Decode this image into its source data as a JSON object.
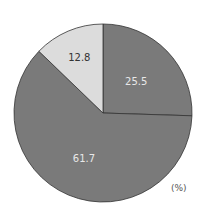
{
  "chart_data": {
    "type": "pie",
    "title": "",
    "unit_label": "(%)",
    "slices": [
      {
        "label": "25.5",
        "value": 25.5,
        "color": "#7a7a7a",
        "text_color": "#e8e8e8"
      },
      {
        "label": "61.7",
        "value": 61.7,
        "color": "#7a7a7a",
        "text_color": "#e8e8e8"
      },
      {
        "label": "12.8",
        "value": 12.8,
        "color": "#dcdcdc",
        "text_color": "#333333"
      }
    ],
    "start_angle_deg": 0,
    "direction": "clockwise",
    "legend": "none"
  }
}
